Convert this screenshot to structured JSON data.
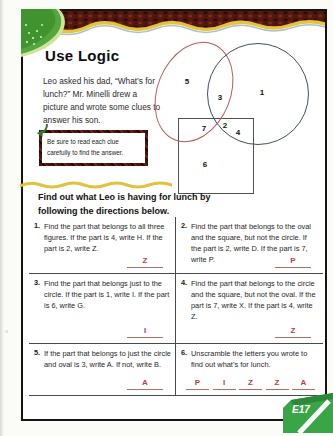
{
  "page": {
    "title": "Use Logic",
    "intro": "Leo asked his dad, “What’s for lunch?” Mr. Minelli drew a picture and wrote some clues to answer his son.",
    "tip": "Be sure to read each clue carefully to find the answer.",
    "instructions_heading": "Find out what Leo is having for lunch by following the directions below.",
    "page_tab": "E17",
    "copyright_mark": "©"
  },
  "diagram": {
    "shapes": [
      {
        "name": "oval",
        "stroke_color": "#b65c52"
      },
      {
        "name": "circle",
        "stroke_color": "#3d4f66"
      },
      {
        "name": "square",
        "stroke_color": "#4f534f"
      }
    ],
    "regions": [
      {
        "label": "1",
        "area": "circle-only"
      },
      {
        "label": "2",
        "area": "oval-circle-square"
      },
      {
        "label": "3",
        "area": "oval-circle"
      },
      {
        "label": "4",
        "area": "circle-square"
      },
      {
        "label": "5",
        "area": "oval-only"
      },
      {
        "label": "6",
        "area": "square-only"
      },
      {
        "label": "7",
        "area": "oval-square"
      }
    ]
  },
  "questions": [
    {
      "num": "1.",
      "text": "Find the part that belongs to all three figures. If the part is 4, write H. If the part is 2, write Z.",
      "answer": "Z"
    },
    {
      "num": "2.",
      "text": "Find the part that belongs to the oval and the square, but not the circle. If the part is 2, write D. If the part is 7, write P.",
      "answer": "P"
    },
    {
      "num": "3.",
      "text": "Find the part that belongs just to the circle. If the part is 1, write I. If the part is 6, write G.",
      "answer": "I"
    },
    {
      "num": "4.",
      "text": "Find the part that belongs to the circle and the square, but not the oval. If the part is 7, write X. If the part is 4, write Z.",
      "answer": "Z"
    },
    {
      "num": "5.",
      "text": "If the part that belongs to just the circle and oval is 3, write A. If not, write B.",
      "answer": "A"
    },
    {
      "num": "6.",
      "text": "Unscramble the letters you wrote to find out what’s for lunch.",
      "answers": [
        "P",
        "I",
        "Z",
        "Z",
        "A"
      ]
    }
  ],
  "colors": {
    "band_maroon": "#54180f",
    "wave_yellow": "#e6c43a",
    "blob_green": "#55a63e",
    "answer_red": "#c43a42",
    "tab_green": "#3aa546"
  }
}
